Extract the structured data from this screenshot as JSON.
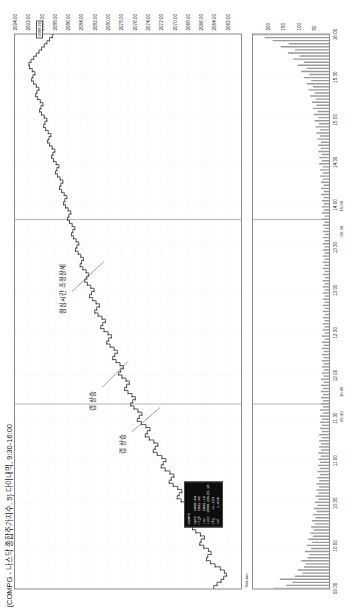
{
  "window": {
    "title": "(COMPG - 나스닥 종합주가지수, 5} 다이내믹, 9:30-16:00"
  },
  "panels": {
    "price_name": "COMPG",
    "volume_name": "Volume"
  },
  "annotations": [
    {
      "id": "gap-up",
      "text": "갭 상승"
    },
    {
      "id": "gap-up-2",
      "text": "갭 상승"
    },
    {
      "id": "lunch-consolidation",
      "text": "점심시간 조정장세"
    }
  ],
  "quote_box": {
    "header": "COMPG",
    "rows": [
      {
        "label": "Open",
        "v1": "2065.04",
        "v2": ""
      },
      {
        "label": "High",
        "v1": "2091.92",
        "v2": ""
      },
      {
        "label": "Low",
        "v1": "2062.18",
        "v2": ""
      },
      {
        "label": "Last",
        "v1": "2088.20",
        "v2": "+23.16"
      },
      {
        "label": "Chg",
        "v1": "+1.12%",
        "v2": ""
      },
      {
        "label": "Vol",
        "v1": "1.82B",
        "v2": ""
      }
    ]
  },
  "last_price_tag": "2088.20",
  "chart_data": {
    "type": "line",
    "title": "(COMPG - 나스닥 종합주가지수, 5} 다이내믹, 9:30-16:00",
    "xlabel": "",
    "ylabel": "",
    "grid": true,
    "legend": "none",
    "ylim": [
      2060.0,
      2094.0
    ],
    "yticks": [
      2062.0,
      2064.0,
      2066.0,
      2068.0,
      2070.0,
      2072.0,
      2074.0,
      2076.0,
      2078.0,
      2080.0,
      2082.0,
      2084.0,
      2086.0,
      2088.0,
      2090.0,
      2092.0,
      2094.0
    ],
    "ytick_labels": [
      "2062.00",
      "2064.00",
      "2066.00",
      "2068.00",
      "2070.00",
      "2072.00",
      "2074.00",
      "2076.00",
      "2078.00",
      "2080.00",
      "2082.00",
      "2084.00",
      "2086.00",
      "2088.00",
      "2090.00",
      "2092.00",
      "2094.00"
    ],
    "xticks_labels": [
      "09:30",
      "10:00",
      "10:30",
      "11:00",
      "11:30",
      "12:00",
      "12:30",
      "13:00",
      "13:30",
      "14:00",
      "14:30",
      "15:00",
      "15:30",
      "16:00"
    ],
    "x_sub_labels": [
      "09:30",
      "15:00",
      "09:30",
      "15:00"
    ],
    "series": [
      {
        "name": "COMPG price",
        "color": "#333333",
        "values": [
          2064.1,
          2063.6,
          2063.0,
          2062.6,
          2062.2,
          2062.5,
          2063.1,
          2063.9,
          2064.6,
          2065.2,
          2065.0,
          2064.5,
          2064.9,
          2065.6,
          2066.2,
          2066.0,
          2065.5,
          2066.1,
          2066.8,
          2067.3,
          2067.0,
          2066.6,
          2067.2,
          2067.9,
          2068.4,
          2068.1,
          2067.7,
          2068.3,
          2069.0,
          2069.6,
          2069.3,
          2068.9,
          2069.5,
          2070.2,
          2070.8,
          2070.5,
          2070.1,
          2070.7,
          2071.4,
          2072.0,
          2071.7,
          2071.3,
          2071.9,
          2072.6,
          2073.2,
          2072.9,
          2072.5,
          2073.1,
          2073.8,
          2074.4,
          2074.1,
          2073.7,
          2074.3,
          2075.0,
          2075.6,
          2075.3,
          2074.9,
          2075.5,
          2076.1,
          2076.6,
          2076.3,
          2075.9,
          2076.4,
          2077.0,
          2077.5,
          2077.2,
          2076.8,
          2077.3,
          2077.9,
          2078.4,
          2078.1,
          2077.7,
          2078.2,
          2078.8,
          2079.3,
          2079.0,
          2078.6,
          2079.1,
          2079.7,
          2080.2,
          2079.9,
          2079.5,
          2080.0,
          2080.6,
          2081.1,
          2080.8,
          2080.4,
          2080.9,
          2081.5,
          2082.0,
          2081.7,
          2081.3,
          2081.8,
          2082.3,
          2082.8,
          2082.5,
          2082.1,
          2082.6,
          2083.1,
          2083.5,
          2083.2,
          2082.9,
          2083.3,
          2083.8,
          2084.2,
          2084.0,
          2083.7,
          2084.1,
          2084.5,
          2084.9,
          2084.7,
          2084.4,
          2084.8,
          2085.2,
          2085.5,
          2085.3,
          2085.0,
          2085.4,
          2085.8,
          2086.1,
          2085.9,
          2085.6,
          2086.0,
          2086.4,
          2086.7,
          2086.5,
          2086.2,
          2086.6,
          2087.0,
          2087.3,
          2087.1,
          2086.8,
          2087.2,
          2087.6,
          2087.9,
          2087.7,
          2087.4,
          2087.8,
          2088.2,
          2088.5,
          2088.3,
          2088.0,
          2088.4,
          2088.8,
          2089.1,
          2088.9,
          2088.6,
          2089.0,
          2089.4,
          2089.7,
          2089.5,
          2089.2,
          2089.6,
          2090.0,
          2090.3,
          2090.1,
          2089.8,
          2090.2,
          2090.6,
          2090.9,
          2090.7,
          2090.4,
          2090.8,
          2091.2,
          2091.5,
          2091.3,
          2091.0,
          2091.4,
          2091.8,
          2091.9,
          2091.6,
          2091.2,
          2090.8,
          2090.4,
          2090.0,
          2089.6,
          2089.2,
          2088.8,
          2088.4,
          2088.2
        ]
      }
    ],
    "volume": {
      "name": "Volume",
      "color": "#9a9a9a",
      "values": [
        62,
        48,
        41,
        55,
        38,
        30,
        35,
        28,
        26,
        31,
        24,
        22,
        27,
        20,
        25,
        19,
        23,
        18,
        21,
        17,
        20,
        16,
        19,
        15,
        18,
        14,
        17,
        13,
        16,
        12,
        15,
        12,
        14,
        11,
        14,
        11,
        13,
        10,
        13,
        10,
        12,
        10,
        12,
        9,
        12,
        9,
        11,
        9,
        11,
        8,
        11,
        8,
        10,
        8,
        10,
        8,
        10,
        7,
        10,
        7,
        9,
        7,
        9,
        7,
        9,
        7,
        9,
        6,
        9,
        6,
        8,
        6,
        8,
        6,
        8,
        6,
        8,
        6,
        8,
        6,
        8,
        5,
        8,
        5,
        7,
        5,
        7,
        5,
        7,
        5,
        7,
        5,
        7,
        5,
        7,
        5,
        7,
        5,
        7,
        5,
        7,
        5,
        7,
        5,
        7,
        5,
        7,
        5,
        7,
        5,
        7,
        5,
        7,
        5,
        7,
        5,
        7,
        5,
        7,
        5,
        8,
        5,
        8,
        6,
        8,
        6,
        8,
        6,
        9,
        6,
        9,
        6,
        9,
        7,
        10,
        7,
        10,
        7,
        11,
        8,
        11,
        8,
        12,
        9,
        12,
        9,
        13,
        10,
        14,
        10,
        15,
        11,
        16,
        12,
        17,
        13,
        18,
        14,
        19,
        15,
        21,
        16,
        23,
        18,
        25,
        20,
        28,
        22,
        31,
        25,
        35,
        28,
        40,
        33,
        46,
        38,
        54,
        45,
        63,
        72,
        85
      ]
    }
  }
}
